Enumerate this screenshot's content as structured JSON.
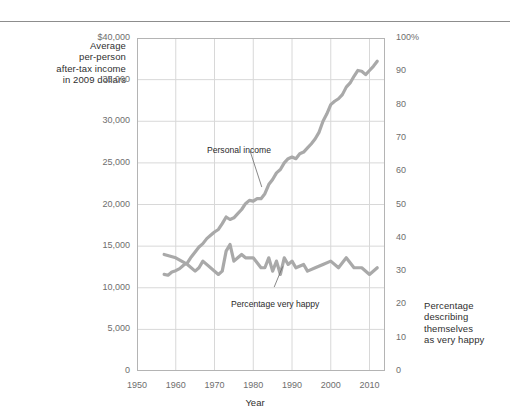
{
  "figure": {
    "left_axis_caption": "Average\nper-person\nafter-tax income\nin 2009 dollars",
    "right_axis_caption": "Percentage\ndescribing\nthemselves\nas very happy",
    "xaxis_title": "Year"
  },
  "annotations": {
    "income_label": "Personal income",
    "happy_label": "Percentage very happy"
  },
  "colors": {
    "line": "#a9a9a9",
    "grid": "#d8d8d8",
    "frame": "#b4b4b4",
    "rule": "#8d8d8d",
    "tick_text": "#6e6e6e",
    "caption_text": "#2f2f2f"
  },
  "chart_data": {
    "type": "line",
    "title": "",
    "xlabel": "Year",
    "grid": true,
    "legend": "none (inline annotations)",
    "xlim": [
      1950,
      2014
    ],
    "xticks": [
      1950,
      1960,
      1970,
      1980,
      1990,
      2000,
      2010
    ],
    "xtick_labels": [
      "1950",
      "1960",
      "1970",
      "1980",
      "1990",
      "2000",
      "2010"
    ],
    "axes": [
      {
        "id": "left",
        "ylabel": "Average per-person after-tax income in 2009 dollars",
        "ylim": [
          0,
          40000
        ],
        "yticks": [
          0,
          5000,
          10000,
          15000,
          20000,
          25000,
          30000,
          35000,
          40000
        ],
        "ytick_labels": [
          "0",
          "5,000",
          "10,000",
          "15,000",
          "20,000",
          "25,000",
          "30,000",
          "35,000",
          "$40,000"
        ]
      },
      {
        "id": "right",
        "ylabel": "Percentage describing themselves as very happy",
        "ylim": [
          0,
          100
        ],
        "yticks": [
          0,
          10,
          20,
          30,
          40,
          50,
          60,
          70,
          80,
          90,
          100
        ],
        "ytick_labels": [
          "0",
          "10",
          "20",
          "30",
          "40",
          "50",
          "60",
          "70",
          "80",
          "90",
          "100%"
        ]
      }
    ],
    "series": [
      {
        "name": "Personal income",
        "axis": "left",
        "units": "2009 dollars",
        "x": [
          1957,
          1958,
          1959,
          1960,
          1961,
          1962,
          1963,
          1964,
          1965,
          1966,
          1967,
          1968,
          1969,
          1970,
          1971,
          1972,
          1973,
          1974,
          1975,
          1976,
          1977,
          1978,
          1979,
          1980,
          1981,
          1982,
          1983,
          1984,
          1985,
          1986,
          1987,
          1988,
          1989,
          1990,
          1991,
          1992,
          1993,
          1994,
          1995,
          1996,
          1997,
          1998,
          1999,
          2000,
          2001,
          2002,
          2003,
          2004,
          2005,
          2006,
          2007,
          2008,
          2009,
          2010,
          2011,
          2012
        ],
        "values": [
          11600,
          11500,
          11900,
          12050,
          12300,
          12700,
          13000,
          13700,
          14300,
          14900,
          15300,
          15900,
          16300,
          16700,
          17000,
          17700,
          18500,
          18200,
          18400,
          18900,
          19400,
          20100,
          20500,
          20400,
          20700,
          20700,
          21300,
          22400,
          23000,
          23800,
          24200,
          25000,
          25500,
          25700,
          25500,
          26100,
          26300,
          26800,
          27300,
          27900,
          28700,
          30000,
          30900,
          32000,
          32400,
          32700,
          33200,
          34100,
          34600,
          35400,
          36100,
          36000,
          35600,
          36100,
          36600,
          37200
        ]
      },
      {
        "name": "Percentage very happy",
        "axis": "right",
        "units": "percent",
        "x": [
          1957,
          1960,
          1963,
          1965,
          1966,
          1967,
          1971,
          1972,
          1973,
          1974,
          1975,
          1976,
          1977,
          1978,
          1980,
          1982,
          1983,
          1984,
          1985,
          1986,
          1987,
          1988,
          1989,
          1990,
          1991,
          1993,
          1994,
          1996,
          1998,
          2000,
          2002,
          2004,
          2006,
          2008,
          2010,
          2012
        ],
        "values": [
          35,
          34,
          32,
          30,
          31,
          33,
          29,
          30,
          36,
          38,
          33,
          34,
          35,
          34,
          34,
          31,
          31,
          34,
          30,
          33,
          29,
          34,
          32,
          33,
          31,
          32,
          30,
          31,
          32,
          33,
          31,
          34,
          31,
          31,
          29,
          31
        ]
      }
    ],
    "annotations": [
      {
        "text": "Personal income",
        "points_to_series": "Personal income",
        "x_near": 1979
      },
      {
        "text": "Percentage very happy",
        "points_to_series": "Percentage very happy",
        "x_near": 1986
      }
    ]
  }
}
